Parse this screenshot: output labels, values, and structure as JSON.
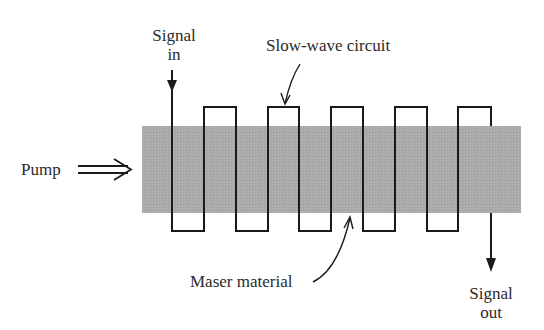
{
  "diagram": {
    "labels": {
      "signal_in_line1": "Signal",
      "signal_in_line2": "in",
      "slow_wave": "Slow-wave circuit",
      "pump": "Pump",
      "maser_material": "Maser material",
      "signal_out_line1": "Signal",
      "signal_out_line2": "out"
    },
    "colors": {
      "band": "#a9a9a9",
      "line": "#1a1a1a",
      "text": "#2a2a2a"
    },
    "band": {
      "x": 142,
      "y": 126,
      "width": 379,
      "height": 87
    },
    "circuit": {
      "top_y": 107,
      "bottom_y": 231,
      "vertical_x": [
        172,
        204,
        236,
        268,
        299,
        331,
        363,
        395,
        427,
        458,
        491
      ]
    }
  }
}
